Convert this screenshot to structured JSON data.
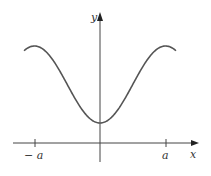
{
  "chart_data": {
    "type": "line",
    "title": "",
    "xlabel": "x",
    "ylabel": "y",
    "tick_labels": [
      "-a",
      "a"
    ],
    "x": [
      -1.15,
      -1.0,
      -0.75,
      -0.5,
      -0.25,
      0,
      0.25,
      0.5,
      0.75,
      1.0,
      1.15
    ],
    "y": [
      0.92,
      1.0,
      0.85,
      0.5,
      0.15,
      0.0,
      0.15,
      0.5,
      0.85,
      1.0,
      0.92
    ],
    "grid": false,
    "legend": null
  },
  "labels": {
    "x_axis": "x",
    "y_axis": "y",
    "neg_tick": "− a",
    "pos_tick": "a"
  },
  "colors": {
    "curve": "#555555",
    "axis": "#444444"
  }
}
